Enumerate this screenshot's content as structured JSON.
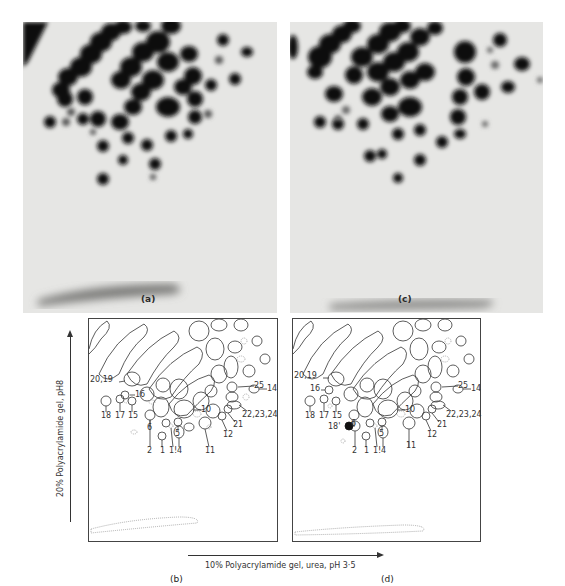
{
  "figure": {
    "panels": [
      {
        "id": "a",
        "label": "(a)",
        "type": "photograph"
      },
      {
        "id": "b",
        "label": "(b)",
        "type": "diagram"
      },
      {
        "id": "c",
        "label": "(c)",
        "type": "photograph"
      },
      {
        "id": "d",
        "label": "(d)",
        "type": "diagram"
      }
    ],
    "y_axis_label": "20% Polyacrylamide gel, pH8",
    "x_axis_label": "10% Polyacrylamide gel, urea, pH 3·5",
    "diagram_b_spot_labels": [
      "20,19",
      "16",
      "18",
      "17",
      "15",
      "6",
      "5",
      "10",
      "25",
      "14",
      "22,23,24",
      "21",
      "12",
      "11",
      "2",
      "1",
      "1!",
      "4"
    ],
    "diagram_d_spot_labels": [
      "20,19",
      "16",
      "18",
      "17",
      "15",
      "6",
      "5",
      "10",
      "25",
      "14",
      "22,23,24",
      "21",
      "12",
      "11",
      "18'",
      "2",
      "1",
      "1!",
      "4"
    ]
  },
  "labels": {
    "a": "(a)",
    "b": "(b)",
    "c": "(c)",
    "d": "(d)"
  },
  "spot_labels": {
    "b": {
      "l20_19": "20,19",
      "l16": "16",
      "l18": "18",
      "l17": "17",
      "l15": "15",
      "l6": "6",
      "l5": "5",
      "l10": "10",
      "l25": "25",
      "l14": "14",
      "l222324": "22,23,24",
      "l21": "21",
      "l12": "12",
      "l11": "11",
      "l2": "2",
      "l1": "1",
      "l1b": "1!",
      "l4": "4"
    },
    "d": {
      "l20_19": "20,19",
      "l16": "16",
      "l18": "18",
      "l17": "17",
      "l15": "15",
      "l6": "6",
      "l5": "5",
      "l10": "10",
      "l25": "25",
      "l14": "14",
      "l222324": "22,23,24",
      "l21": "21",
      "l12": "12",
      "l11": "11",
      "l18p": "18'",
      "l2": "2",
      "l1": "1",
      "l1b": "1!",
      "l4": "4"
    }
  }
}
